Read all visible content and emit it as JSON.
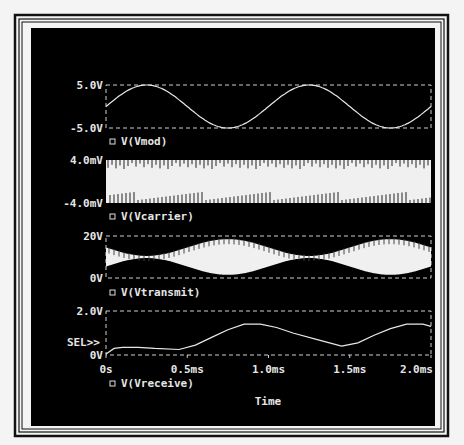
{
  "window": {
    "background": "#f4f4f4",
    "plot_background": "#000000",
    "trace_color": "#e8e8e8",
    "frame_color": "#111111"
  },
  "x_axis": {
    "label": "Time",
    "ticks": [
      "0s",
      "0.5ms",
      "1.0ms",
      "1.5ms",
      "2.0ms"
    ],
    "range_ms": [
      0,
      2.0
    ]
  },
  "selection_marker": "SEL>>",
  "chart_data": [
    {
      "type": "line",
      "title": "V(Vmod)",
      "legend": "V(Vmod)",
      "ylabel": "",
      "xlabel": "Time",
      "y_ticks": [
        "5.0V",
        "-5.0V"
      ],
      "ylim": [
        -5.0,
        5.0
      ],
      "x_ms": [
        0,
        0.25,
        0.5,
        0.75,
        1.0,
        1.25,
        1.5,
        1.75,
        2.0
      ],
      "values": [
        0,
        5.0,
        0,
        -5.0,
        0,
        5.0,
        0,
        -5.0,
        0
      ],
      "description": "1 kHz sine, 5 V amplitude"
    },
    {
      "type": "line",
      "title": "V(Vcarrier)",
      "legend": "V(Vcarrier)",
      "y_ticks": [
        "4.0mV",
        "-4.0mV"
      ],
      "ylim": [
        -4.0,
        4.0
      ],
      "unit": "mV",
      "description": "high-frequency carrier filling band between -4.0mV and 4.0mV",
      "amplitude_mV": 4.0
    },
    {
      "type": "area",
      "title": "V(Vtransmit)",
      "legend": "V(Vtransmit)",
      "y_ticks": [
        "20V",
        "0V"
      ],
      "ylim": [
        0,
        20
      ],
      "center_V": 10,
      "x_ms": [
        0,
        0.25,
        0.5,
        0.75,
        1.0,
        1.25,
        1.5,
        1.75,
        2.0
      ],
      "envelope_upper": [
        14,
        10.8,
        14,
        18.5,
        14,
        10.8,
        14,
        18.5,
        14
      ],
      "envelope_lower": [
        6,
        9.2,
        6,
        1.5,
        6,
        9.2,
        6,
        1.5,
        6
      ],
      "description": "AM modulated signal envelope"
    },
    {
      "type": "line",
      "title": "V(Vreceive)",
      "legend": "V(Vreceive)",
      "y_ticks": [
        "2.0V",
        "0V"
      ],
      "ylim": [
        0,
        2.0
      ],
      "x_ms": [
        0,
        0.05,
        0.1,
        0.2,
        0.3,
        0.45,
        0.55,
        0.65,
        0.75,
        0.85,
        0.95,
        1.05,
        1.15,
        1.3,
        1.45,
        1.55,
        1.65,
        1.75,
        1.85,
        1.95,
        2.0
      ],
      "values": [
        0.05,
        0.3,
        0.35,
        0.35,
        0.3,
        0.25,
        0.45,
        0.8,
        1.15,
        1.4,
        1.4,
        1.25,
        1.0,
        0.7,
        0.4,
        0.55,
        0.9,
        1.2,
        1.4,
        1.4,
        1.3
      ]
    }
  ]
}
